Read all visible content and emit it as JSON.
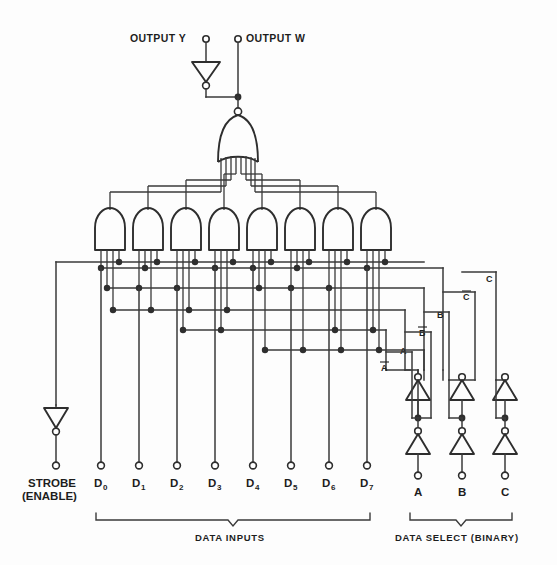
{
  "diagram": {
    "outputs": [
      {
        "id": "y",
        "label": "OUTPUT Y",
        "inverted": true
      },
      {
        "id": "w",
        "label": "OUTPUT W",
        "inverted": false
      }
    ],
    "strobe": {
      "label_line1": "STROBE",
      "label_line2": "(ENABLE)"
    },
    "data_inputs": [
      {
        "base": "D",
        "sub": "0"
      },
      {
        "base": "D",
        "sub": "1"
      },
      {
        "base": "D",
        "sub": "2"
      },
      {
        "base": "D",
        "sub": "3"
      },
      {
        "base": "D",
        "sub": "4"
      },
      {
        "base": "D",
        "sub": "5"
      },
      {
        "base": "D",
        "sub": "6"
      },
      {
        "base": "D",
        "sub": "7"
      }
    ],
    "select_inputs": [
      {
        "label": "A"
      },
      {
        "label": "B"
      },
      {
        "label": "C"
      }
    ],
    "select_rails": [
      {
        "label": "A",
        "complement": true
      },
      {
        "label": "A",
        "complement": false
      },
      {
        "label": "B",
        "complement": true
      },
      {
        "label": "B",
        "complement": false
      },
      {
        "label": "C",
        "complement": true
      },
      {
        "label": "C",
        "complement": false
      }
    ],
    "group_labels": {
      "data_inputs": "DATA INPUTS",
      "data_select": "DATA SELECT (BINARY)"
    },
    "gates": {
      "and_gate_count": 8,
      "and_gate_inputs": 4,
      "nor_gate_inputs": 8,
      "select_buffer_pairs": 3
    },
    "colors": {
      "background": "#fdfdfd",
      "line": "#3a3a3a",
      "gate": "#2e2e2e",
      "text": "#1d1d1d"
    }
  }
}
